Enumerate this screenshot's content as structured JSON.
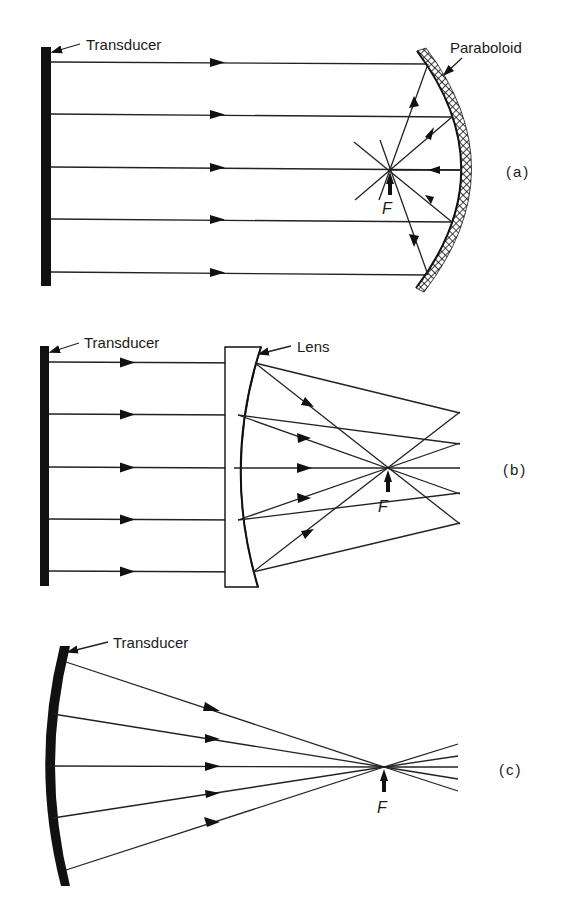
{
  "figure": {
    "panels": [
      {
        "id": "a",
        "label": "(a)",
        "transducer_label": "Transducer",
        "element_label": "Paraboloid",
        "focus_label": "F",
        "description": "Flat transducer emits parallel rays reflected by a paraboloid mirror to focus F"
      },
      {
        "id": "b",
        "label": "(b)",
        "transducer_label": "Transducer",
        "element_label": "Lens",
        "focus_label": "F",
        "description": "Flat transducer emits parallel rays refracted by a plano-concave lens to focus F"
      },
      {
        "id": "c",
        "label": "(c)",
        "transducer_label": "Transducer",
        "focus_label": "F",
        "description": "Curved transducer emits converging rays to focus F"
      }
    ]
  },
  "colors": {
    "ink": "#111111",
    "background": "#ffffff"
  }
}
